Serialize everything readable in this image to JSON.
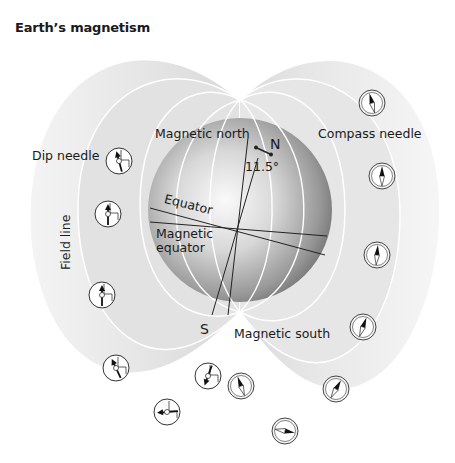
{
  "title": "Earth’s magnetism",
  "labels": {
    "magnetic_north": "Magnetic north",
    "geographic_north": "N",
    "angle": "11.5°",
    "compass_needle": "Compass needle",
    "dip_needle": "Dip needle",
    "equator": "Equator",
    "magnetic_equator_line1": "Magnetic",
    "magnetic_equator_line2": "equator",
    "field_line": "Field line",
    "geographic_south": "S",
    "magnetic_south": "Magnetic south"
  },
  "colors": {
    "background": "#ffffff",
    "field_shell": "#e6e6e6",
    "globe_dark": "#8a8a8a",
    "globe_light": "#f2f2f2",
    "line": "#222222"
  },
  "dip_needles": [
    {
      "x": 119,
      "y": 161,
      "angle": -15
    },
    {
      "x": 108,
      "y": 214,
      "angle": 0
    },
    {
      "x": 102,
      "y": 295,
      "angle": 0
    },
    {
      "x": 116,
      "y": 368,
      "angle": -25
    },
    {
      "x": 208,
      "y": 376,
      "angle": 200
    },
    {
      "x": 167,
      "y": 412,
      "angle": 265
    }
  ],
  "compass_needles": [
    {
      "x": 372,
      "y": 103,
      "angle": -15
    },
    {
      "x": 382,
      "y": 176,
      "angle": 0
    },
    {
      "x": 377,
      "y": 255,
      "angle": 5
    },
    {
      "x": 363,
      "y": 327,
      "angle": 20
    },
    {
      "x": 336,
      "y": 389,
      "angle": 30
    },
    {
      "x": 285,
      "y": 431,
      "angle": 100
    },
    {
      "x": 241,
      "y": 386,
      "angle": -20
    }
  ]
}
